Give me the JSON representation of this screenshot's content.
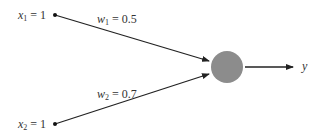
{
  "diagram": {
    "type": "perceptron",
    "inputs": [
      {
        "var": "x",
        "sub": "1",
        "value": "= 1"
      },
      {
        "var": "x",
        "sub": "2",
        "value": "= 1"
      }
    ],
    "weights": [
      {
        "var": "w",
        "sub": "1",
        "value": "= 0.5"
      },
      {
        "var": "w",
        "sub": "2",
        "value": "= 0.7"
      }
    ],
    "neuron": {
      "fill": "#8c8c8c"
    },
    "output": {
      "var": "y"
    }
  }
}
